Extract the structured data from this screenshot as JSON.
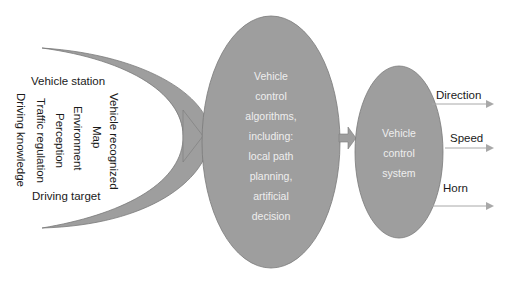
{
  "inputs": {
    "horizontal_top": "Vehicle station",
    "horizontal_bottom": "Driving target",
    "vertical": [
      "Vehicle recognized",
      "Map",
      "Environment",
      "Perception",
      "Traffic regulation",
      "Driving knowledge"
    ]
  },
  "algorithms_node": {
    "lines": [
      "Vehicle",
      "control",
      "algorithms,",
      "including:",
      "local path",
      "planning,",
      "artificial",
      "decision"
    ]
  },
  "control_node": {
    "lines": [
      "Vehicle",
      "control",
      "system"
    ]
  },
  "outputs": [
    "Direction",
    "Speed",
    "Horn"
  ],
  "colors": {
    "shape_fill": "#9e9e9e",
    "shape_stroke": "#7a7a7a",
    "arrow_line": "#a8a8a8",
    "label_text": "#1a1a1a",
    "inner_text": "#eeeeee"
  }
}
